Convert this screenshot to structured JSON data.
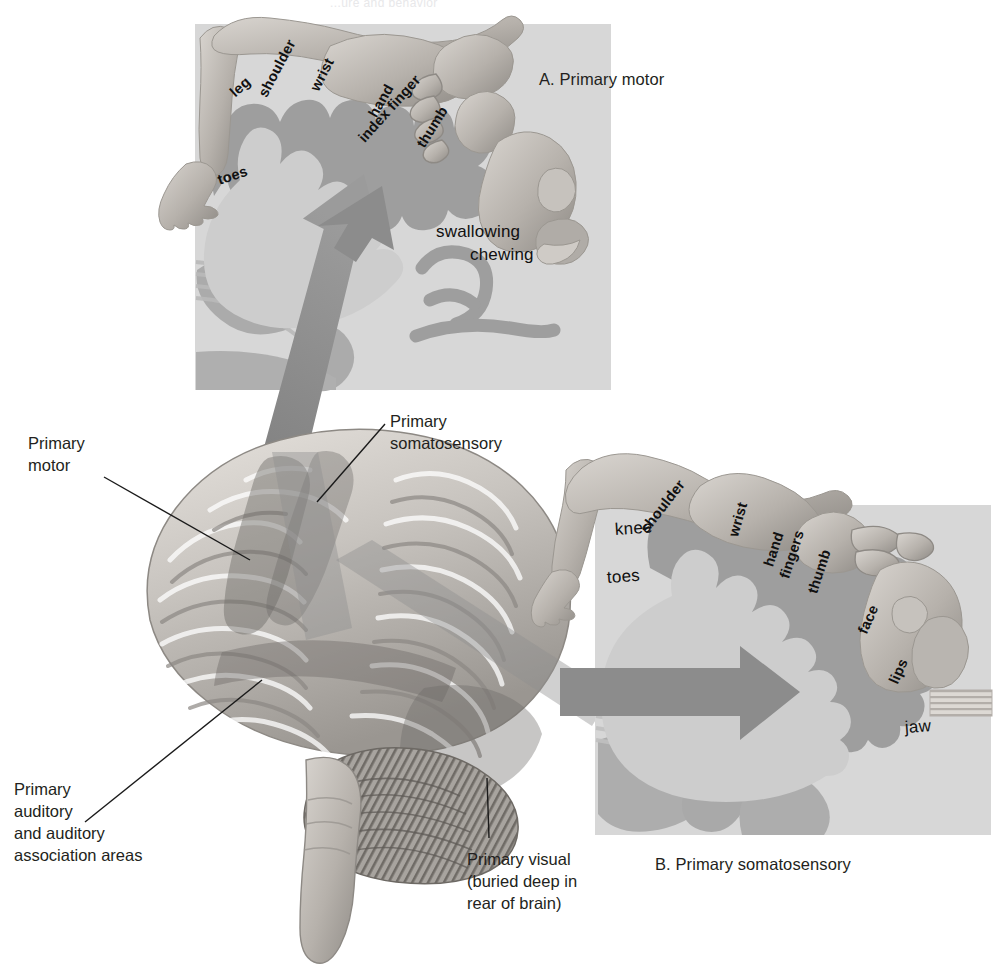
{
  "page": {
    "running_head": "...ure and behavior",
    "background": "#ffffff",
    "ink": "#231f20"
  },
  "colors": {
    "panel_background": "#d9d9d9",
    "cortex_band": "#9a9a9a",
    "cortex_interior": "#c9c9c9",
    "arrow": "#8c8c8c",
    "arrow_dark": "#7d7d7d",
    "brain_light": "#d6d2cd",
    "brain_mid": "#a9a5a0",
    "brain_dark": "#7e7a76",
    "leader_line": "#1a1a1a",
    "body_figure": "#bdb8b2"
  },
  "panels": [
    {
      "id": "A",
      "caption": "A. Primary motor",
      "region": "motor-homunculus",
      "labels": [
        {
          "text": "leg",
          "x": 232,
          "y": 86,
          "rotate": -42
        },
        {
          "text": "shoulder",
          "x": 262,
          "y": 88,
          "rotate": -62
        },
        {
          "text": "wrist",
          "x": 314,
          "y": 82,
          "rotate": -63
        },
        {
          "text": "hand",
          "x": 372,
          "y": 108,
          "rotate": -60
        },
        {
          "text": "index finger",
          "x": 361,
          "y": 132,
          "rotate": -48
        },
        {
          "text": "thumb",
          "x": 420,
          "y": 138,
          "rotate": -58
        },
        {
          "text": "toes",
          "x": 218,
          "y": 172,
          "rotate": -18
        },
        {
          "text": "swallowing",
          "x": 436,
          "y": 222,
          "rotate": 0,
          "size": "big"
        },
        {
          "text": "chewing",
          "x": 470,
          "y": 245,
          "rotate": 0,
          "size": "big"
        }
      ]
    },
    {
      "id": "B",
      "caption": "B. Primary somatosensory",
      "region": "somatosensory-homunculus",
      "labels": [
        {
          "text": "knee",
          "x": 615,
          "y": 520,
          "rotate": -4
        },
        {
          "text": "shoulder",
          "x": 643,
          "y": 523,
          "rotate": -52
        },
        {
          "text": "toes",
          "x": 607,
          "y": 568,
          "rotate": -4
        },
        {
          "text": "wrist",
          "x": 733,
          "y": 528,
          "rotate": -74
        },
        {
          "text": "hand",
          "x": 768,
          "y": 558,
          "rotate": -72
        },
        {
          "text": "fingers",
          "x": 784,
          "y": 570,
          "rotate": -72
        },
        {
          "text": "thumb",
          "x": 812,
          "y": 585,
          "rotate": -72
        },
        {
          "text": "face",
          "x": 862,
          "y": 625,
          "rotate": -66
        },
        {
          "text": "lips",
          "x": 893,
          "y": 675,
          "rotate": -66
        },
        {
          "text": "jaw",
          "x": 905,
          "y": 718,
          "rotate": -4
        }
      ]
    }
  ],
  "callouts": [
    {
      "id": "primary-motor",
      "lines": [
        "Primary",
        "motor"
      ],
      "leader": {
        "x1": 104,
        "y1": 477,
        "x2": 250,
        "y2": 560
      }
    },
    {
      "id": "primary-somatosensory",
      "lines": [
        "Primary",
        "somatosensory"
      ],
      "leader": {
        "x1": 385,
        "y1": 424,
        "x2": 317,
        "y2": 502
      }
    },
    {
      "id": "primary-auditory",
      "lines": [
        "Primary",
        "auditory",
        "and auditory",
        "association areas"
      ],
      "leader": {
        "x1": 85,
        "y1": 822,
        "x2": 262,
        "y2": 680
      }
    },
    {
      "id": "primary-visual",
      "lines": [
        "Primary visual",
        "(buried deep in",
        "rear of brain)"
      ],
      "leader": {
        "x1": 489,
        "y1": 838,
        "x2": 487,
        "y2": 778
      }
    }
  ],
  "arrows": [
    {
      "id": "motor-arrow",
      "from": "precentral-gyrus",
      "to": "panel-A",
      "direction": "up-right"
    },
    {
      "id": "somatosensory-arrow",
      "from": "postcentral-gyrus",
      "to": "panel-B",
      "direction": "right"
    }
  ],
  "brain": {
    "id": "lateral-brain-illustration",
    "shaded_regions": [
      "primary motor strip",
      "primary somatosensory strip",
      "auditory band",
      "visual region"
    ],
    "parts": [
      "cerebrum",
      "cerebellum",
      "brain stem"
    ]
  }
}
